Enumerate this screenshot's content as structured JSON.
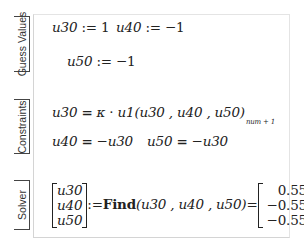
{
  "regions": {
    "guess": {
      "label": "Guess Values",
      "u30_assign": {
        "var": "u30",
        "op": ":=",
        "value": "1"
      },
      "u40_assign": {
        "var": "u40",
        "op": ":=",
        "value": "−1"
      },
      "u50_assign": {
        "var": "u50",
        "op": ":=",
        "value": "−1"
      }
    },
    "constraints": {
      "label": "Constraints",
      "eq1": {
        "lhs": "u30",
        "op": "=",
        "kappa": "κ",
        "dot": "·",
        "func": "u1",
        "args": "(u30 , u40 , u50)",
        "subscript": "num + 1"
      },
      "eq2": {
        "lhs": "u40",
        "op": "=",
        "rhs": "−u30"
      },
      "eq3": {
        "lhs": "u50",
        "op": "=",
        "rhs": "−u30"
      }
    },
    "solver": {
      "label": "Solver",
      "vars": [
        "u30",
        "u40",
        "u50"
      ],
      "assign_op": ":=",
      "func": "Find",
      "args": "(u30 , u40 , u50)",
      "eq_op": "=",
      "results": [
        "0.555",
        "−0.555",
        "−0.555"
      ]
    }
  }
}
